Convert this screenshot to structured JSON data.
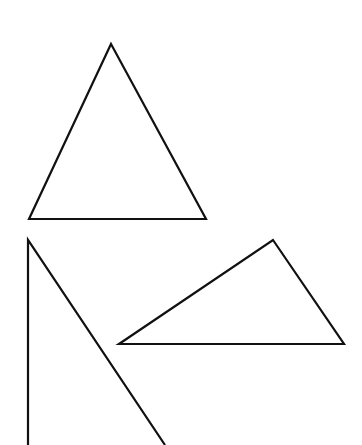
{
  "canvas": {
    "width": 362,
    "height": 445,
    "background_color": "#ffffff",
    "stroke_color": "#111111",
    "stroke_width": 2.2
  },
  "shapes": [
    {
      "name": "upper-triangle",
      "type": "triangle",
      "closed": true,
      "points": "111,44 206,219 29,219",
      "vertices": [
        {
          "label": "apex",
          "x": 111,
          "y": 44
        },
        {
          "label": "bottom-right",
          "x": 206,
          "y": 219
        },
        {
          "label": "bottom-left",
          "x": 29,
          "y": 219
        }
      ]
    },
    {
      "name": "lower-left-open-wedge",
      "type": "open-polyline",
      "closed": false,
      "points": "28,445 28,240 165,445",
      "vertices": [
        {
          "label": "vertical-ray-bottom",
          "x": 28,
          "y": 445
        },
        {
          "label": "apex",
          "x": 28,
          "y": 240
        },
        {
          "label": "diagonal-ray-bottom",
          "x": 165,
          "y": 445
        }
      ]
    },
    {
      "name": "lower-right-triangle",
      "type": "triangle",
      "closed": true,
      "points": "273,240 344,344 119,344",
      "vertices": [
        {
          "label": "apex",
          "x": 273,
          "y": 240
        },
        {
          "label": "bottom-right",
          "x": 344,
          "y": 344
        },
        {
          "label": "bottom-left",
          "x": 119,
          "y": 344
        }
      ]
    }
  ]
}
